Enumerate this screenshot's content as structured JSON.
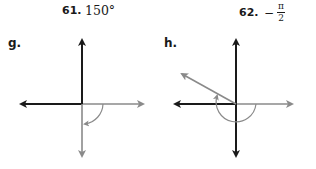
{
  "problems": [
    {
      "number": "61.",
      "value": "150°",
      "panel_letter": "g.",
      "angle_description": "Initial side on positive x-axis, rotated clockwise to negative y-axis (-90°)",
      "colors": {
        "initial_side": "#8a8a8a",
        "terminal_side": "#8a8a8a",
        "axes": "#1a1a1a",
        "arc": "#8a8a8a"
      }
    },
    {
      "number": "62.",
      "value_sign": "−",
      "value_numerator": "π",
      "value_denominator": "2",
      "panel_letter": "h.",
      "angle_description": "Initial side on positive x-axis, rotated clockwise about 210° to terminal ray in second quadrant (150° position)",
      "colors": {
        "initial_side": "#8a8a8a",
        "terminal_side": "#8a8a8a",
        "axes": "#1a1a1a",
        "arc": "#8a8a8a"
      }
    }
  ]
}
